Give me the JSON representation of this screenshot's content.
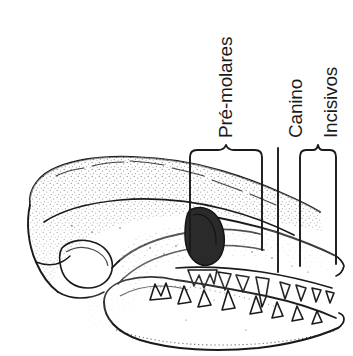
{
  "figure": {
    "background_color": "#ffffff",
    "ink_color": "#1a1a1a",
    "width": 353,
    "height": 356
  },
  "labels": {
    "premolares": "Pré-molares",
    "canino": "Canino",
    "incisivos": "Incisivos"
  },
  "annotations": [
    {
      "name": "premolares",
      "label": "Pré-molares",
      "marker": "brace",
      "x_start": 190,
      "x_end": 262,
      "tip_x": 226,
      "top_y": 146,
      "bottom_y": 252
    },
    {
      "name": "canino",
      "label": "Canino",
      "marker": "line",
      "x_start": 278,
      "x_end": 278,
      "tip_x": 278,
      "top_y": 148,
      "bottom_y": 272
    },
    {
      "name": "incisivos",
      "label": "Incisivos",
      "marker": "brace",
      "x_start": 300,
      "x_end": 336,
      "tip_x": 318,
      "top_y": 146,
      "bottom_y": 266
    }
  ],
  "illustration": {
    "subject": "skull-lateral-view",
    "style": "stippled-line-drawing",
    "parts": [
      "cranium",
      "orbit",
      "zygomatic-arch",
      "maxilla",
      "mandible",
      "upper-teeth",
      "lower-teeth"
    ]
  }
}
